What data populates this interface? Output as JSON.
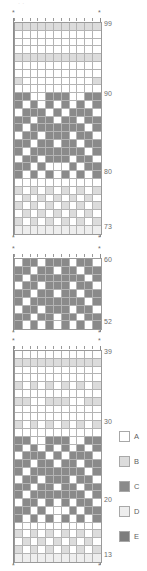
{
  "document": {
    "type": "colorwork-stitch-chart",
    "top_note": "· ·"
  },
  "legend": {
    "items": [
      {
        "key": "A",
        "label": "A",
        "color": "#ffffff",
        "swatch_class": "cA"
      },
      {
        "key": "B",
        "label": "B",
        "color": "#dcdcdc",
        "swatch_class": "cB"
      },
      {
        "key": "C",
        "label": "C",
        "color": "#8a8a8a",
        "swatch_class": "cC"
      },
      {
        "key": "D",
        "label": "D",
        "color": "#eeeeee",
        "swatch_class": "cD"
      },
      {
        "key": "E",
        "label": "E",
        "color": "#7d7d7d",
        "swatch_class": "cE"
      }
    ]
  },
  "chart_data": {
    "type": "heatmap",
    "title": "",
    "xlabel": "",
    "ylabel": "",
    "columns": 11,
    "palette": {
      "A": "#ffffff",
      "B": "#dcdcdc",
      "C": "#8a8a8a",
      "D": "#eeeeee",
      "E": "#7d7d7d"
    },
    "charts": [
      {
        "name": "chart-top",
        "top": 22,
        "row_range": [
          73,
          99
        ],
        "row_labels": [
          {
            "value": "99",
            "row_index": 0
          },
          {
            "value": "90",
            "row_index": 9
          },
          {
            "value": "80",
            "row_index": 19
          },
          {
            "value": "73",
            "row_index": 26
          }
        ],
        "rows": [
          [
            "B",
            "B",
            "B",
            "B",
            "B",
            "B",
            "B",
            "B",
            "B",
            "B",
            "B"
          ],
          [
            "A",
            "A",
            "A",
            "A",
            "A",
            "A",
            "A",
            "A",
            "A",
            "A",
            "A"
          ],
          [
            "A",
            "A",
            "A",
            "A",
            "A",
            "A",
            "A",
            "A",
            "A",
            "A",
            "A"
          ],
          [
            "A",
            "A",
            "A",
            "A",
            "A",
            "A",
            "A",
            "A",
            "A",
            "A",
            "A"
          ],
          [
            "B",
            "B",
            "B",
            "B",
            "B",
            "B",
            "B",
            "B",
            "B",
            "B",
            "B"
          ],
          [
            "A",
            "A",
            "A",
            "A",
            "A",
            "A",
            "A",
            "A",
            "A",
            "A",
            "A"
          ],
          [
            "A",
            "A",
            "A",
            "A",
            "A",
            "A",
            "A",
            "A",
            "A",
            "A",
            "A"
          ],
          [
            "B",
            "A",
            "A",
            "A",
            "A",
            "A",
            "A",
            "A",
            "A",
            "A",
            "B"
          ],
          [
            "A",
            "A",
            "A",
            "A",
            "A",
            "A",
            "A",
            "A",
            "A",
            "A",
            "A"
          ],
          [
            "C",
            "C",
            "A",
            "A",
            "C",
            "C",
            "C",
            "A",
            "A",
            "C",
            "C"
          ],
          [
            "C",
            "A",
            "C",
            "A",
            "C",
            "A",
            "C",
            "A",
            "C",
            "A",
            "C"
          ],
          [
            "A",
            "C",
            "C",
            "C",
            "A",
            "C",
            "A",
            "C",
            "C",
            "C",
            "A"
          ],
          [
            "C",
            "C",
            "A",
            "C",
            "C",
            "A",
            "C",
            "C",
            "A",
            "C",
            "C"
          ],
          [
            "C",
            "A",
            "C",
            "C",
            "C",
            "C",
            "C",
            "C",
            "C",
            "A",
            "C"
          ],
          [
            "A",
            "C",
            "C",
            "A",
            "C",
            "C",
            "C",
            "A",
            "C",
            "C",
            "A"
          ],
          [
            "C",
            "C",
            "A",
            "C",
            "C",
            "A",
            "C",
            "C",
            "A",
            "C",
            "C"
          ],
          [
            "C",
            "A",
            "C",
            "C",
            "C",
            "C",
            "C",
            "C",
            "C",
            "A",
            "C"
          ],
          [
            "A",
            "C",
            "C",
            "A",
            "C",
            "C",
            "C",
            "A",
            "C",
            "C",
            "A"
          ],
          [
            "C",
            "C",
            "A",
            "C",
            "A",
            "A",
            "A",
            "C",
            "A",
            "C",
            "C"
          ],
          [
            "C",
            "A",
            "C",
            "A",
            "C",
            "A",
            "C",
            "A",
            "C",
            "A",
            "C"
          ],
          [
            "A",
            "A",
            "A",
            "A",
            "A",
            "A",
            "A",
            "A",
            "A",
            "A",
            "A"
          ],
          [
            "B",
            "A",
            "B",
            "A",
            "B",
            "A",
            "B",
            "A",
            "B",
            "A",
            "B"
          ],
          [
            "A",
            "B",
            "A",
            "B",
            "A",
            "B",
            "A",
            "B",
            "A",
            "B",
            "A"
          ],
          [
            "B",
            "A",
            "B",
            "A",
            "B",
            "A",
            "B",
            "A",
            "B",
            "A",
            "B"
          ],
          [
            "A",
            "B",
            "A",
            "B",
            "A",
            "B",
            "A",
            "B",
            "A",
            "B",
            "A"
          ],
          [
            "B",
            "A",
            "B",
            "A",
            "B",
            "A",
            "B",
            "A",
            "B",
            "A",
            "B"
          ],
          [
            "D",
            "D",
            "D",
            "D",
            "D",
            "D",
            "D",
            "D",
            "D",
            "D",
            "D"
          ]
        ]
      },
      {
        "name": "chart-middle",
        "top": 258,
        "row_range": [
          52,
          60
        ],
        "row_labels": [
          {
            "value": "60",
            "row_index": 0
          },
          {
            "value": "52",
            "row_index": 8
          }
        ],
        "rows": [
          [
            "A",
            "C",
            "C",
            "A",
            "C",
            "C",
            "C",
            "A",
            "C",
            "C",
            "A"
          ],
          [
            "C",
            "C",
            "A",
            "C",
            "C",
            "A",
            "C",
            "C",
            "A",
            "C",
            "C"
          ],
          [
            "C",
            "A",
            "C",
            "C",
            "C",
            "C",
            "C",
            "C",
            "C",
            "A",
            "C"
          ],
          [
            "A",
            "C",
            "C",
            "A",
            "C",
            "C",
            "C",
            "A",
            "C",
            "C",
            "A"
          ],
          [
            "C",
            "C",
            "A",
            "C",
            "C",
            "A",
            "C",
            "C",
            "A",
            "C",
            "C"
          ],
          [
            "C",
            "A",
            "C",
            "C",
            "C",
            "C",
            "C",
            "C",
            "C",
            "A",
            "C"
          ],
          [
            "A",
            "C",
            "C",
            "A",
            "C",
            "C",
            "C",
            "A",
            "C",
            "C",
            "A"
          ],
          [
            "C",
            "C",
            "A",
            "C",
            "C",
            "A",
            "C",
            "C",
            "A",
            "C",
            "C"
          ],
          [
            "C",
            "A",
            "C",
            "A",
            "C",
            "A",
            "C",
            "A",
            "C",
            "A",
            "C"
          ]
        ]
      },
      {
        "name": "chart-bottom",
        "top": 350,
        "row_range": [
          13,
          39
        ],
        "row_labels": [
          {
            "value": "39",
            "row_index": 0
          },
          {
            "value": "30",
            "row_index": 9
          },
          {
            "value": "20",
            "row_index": 19
          },
          {
            "value": "13",
            "row_index": 26
          }
        ],
        "rows": [
          [
            "A",
            "A",
            "A",
            "A",
            "A",
            "A",
            "A",
            "A",
            "A",
            "A",
            "A"
          ],
          [
            "B",
            "B",
            "B",
            "B",
            "B",
            "B",
            "B",
            "B",
            "B",
            "B",
            "B"
          ],
          [
            "A",
            "A",
            "A",
            "A",
            "A",
            "A",
            "A",
            "A",
            "A",
            "A",
            "A"
          ],
          [
            "A",
            "A",
            "A",
            "A",
            "A",
            "A",
            "A",
            "A",
            "A",
            "A",
            "A"
          ],
          [
            "B",
            "A",
            "B",
            "A",
            "B",
            "A",
            "B",
            "A",
            "B",
            "A",
            "B"
          ],
          [
            "A",
            "A",
            "A",
            "A",
            "A",
            "A",
            "A",
            "A",
            "A",
            "A",
            "A"
          ],
          [
            "B",
            "B",
            "A",
            "A",
            "B",
            "B",
            "B",
            "A",
            "A",
            "B",
            "B"
          ],
          [
            "A",
            "A",
            "A",
            "A",
            "A",
            "A",
            "A",
            "A",
            "A",
            "A",
            "A"
          ],
          [
            "A",
            "A",
            "A",
            "A",
            "A",
            "A",
            "A",
            "A",
            "A",
            "A",
            "A"
          ],
          [
            "B",
            "A",
            "B",
            "A",
            "B",
            "A",
            "B",
            "A",
            "B",
            "A",
            "B"
          ],
          [
            "A",
            "A",
            "A",
            "A",
            "A",
            "A",
            "A",
            "A",
            "A",
            "A",
            "A"
          ],
          [
            "C",
            "C",
            "A",
            "A",
            "C",
            "C",
            "C",
            "A",
            "A",
            "C",
            "C"
          ],
          [
            "C",
            "A",
            "C",
            "A",
            "C",
            "A",
            "C",
            "A",
            "C",
            "A",
            "C"
          ],
          [
            "A",
            "C",
            "C",
            "C",
            "A",
            "C",
            "A",
            "C",
            "C",
            "C",
            "A"
          ],
          [
            "C",
            "C",
            "A",
            "C",
            "C",
            "A",
            "C",
            "C",
            "A",
            "C",
            "C"
          ],
          [
            "C",
            "A",
            "C",
            "C",
            "C",
            "C",
            "C",
            "C",
            "C",
            "A",
            "C"
          ],
          [
            "A",
            "C",
            "C",
            "A",
            "C",
            "C",
            "C",
            "A",
            "C",
            "C",
            "A"
          ],
          [
            "C",
            "C",
            "A",
            "C",
            "C",
            "A",
            "C",
            "C",
            "A",
            "C",
            "C"
          ],
          [
            "C",
            "A",
            "C",
            "C",
            "C",
            "C",
            "C",
            "C",
            "C",
            "A",
            "C"
          ],
          [
            "A",
            "C",
            "C",
            "A",
            "C",
            "A",
            "C",
            "A",
            "C",
            "C",
            "A"
          ],
          [
            "C",
            "C",
            "A",
            "C",
            "A",
            "A",
            "A",
            "C",
            "A",
            "C",
            "C"
          ],
          [
            "C",
            "A",
            "C",
            "A",
            "C",
            "A",
            "C",
            "A",
            "C",
            "A",
            "C"
          ],
          [
            "A",
            "A",
            "A",
            "A",
            "A",
            "A",
            "A",
            "A",
            "A",
            "A",
            "A"
          ],
          [
            "B",
            "A",
            "B",
            "A",
            "B",
            "A",
            "B",
            "A",
            "B",
            "A",
            "B"
          ],
          [
            "A",
            "B",
            "A",
            "B",
            "A",
            "B",
            "A",
            "B",
            "A",
            "B",
            "A"
          ],
          [
            "B",
            "A",
            "B",
            "A",
            "B",
            "A",
            "B",
            "A",
            "B",
            "A",
            "B"
          ],
          [
            "D",
            "D",
            "D",
            "D",
            "D",
            "D",
            "D",
            "D",
            "D",
            "D",
            "D"
          ]
        ]
      }
    ]
  }
}
